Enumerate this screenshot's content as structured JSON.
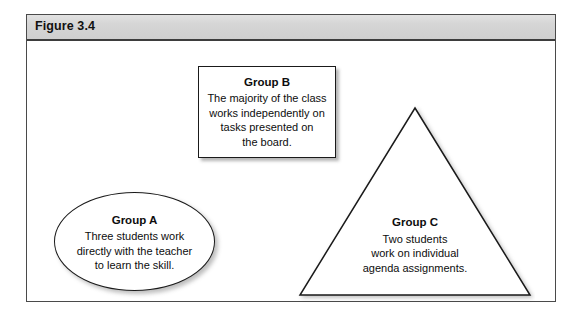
{
  "figure": {
    "header_title": "Figure 3.4",
    "frame_border_color": "#4a4a4a",
    "header_bg_color": "#d6d6d6",
    "canvas_bg_color": "#ffffff",
    "shape_stroke_color": "#1a1a1a"
  },
  "shapes": {
    "group_a": {
      "kind": "ellipse",
      "title": "Group A",
      "body": "Three students work\ndirectly with the teacher\nto learn the skill."
    },
    "group_b": {
      "kind": "rectangle",
      "title": "Group B",
      "body": "The majority of the class\nworks independently on\ntasks presented on\nthe board."
    },
    "group_c": {
      "kind": "triangle",
      "title": "Group C",
      "body": "Two students\nwork on individual\nagenda assignments."
    }
  }
}
